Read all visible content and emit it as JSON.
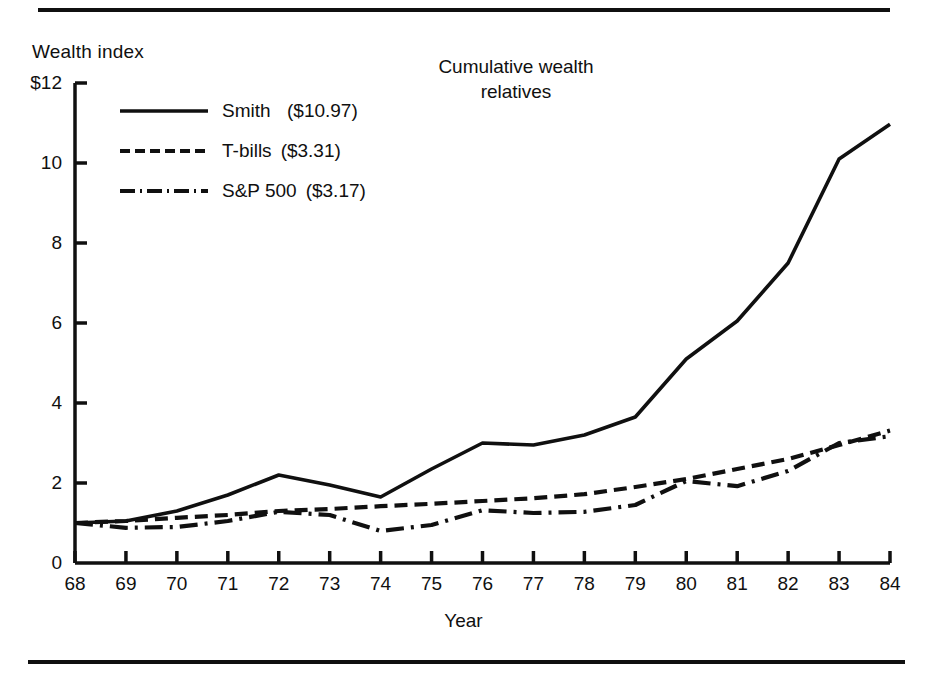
{
  "figure": {
    "title_line_1": "Cumulative wealth",
    "title_line_2": "relatives",
    "y_axis_title": "Wealth index",
    "x_axis_title": "Year"
  },
  "legend": {
    "items": [
      {
        "name": "Smith",
        "label": "Smith",
        "value": "($10.97)",
        "style": "solid",
        "color": "#101010"
      },
      {
        "name": "T-bills",
        "label": "T-bills",
        "value": "($3.31)",
        "style": "dashed",
        "color": "#101010"
      },
      {
        "name": "S&P 500",
        "label": "S&P 500",
        "value": "($3.17)",
        "style": "dash-dot",
        "color": "#101010"
      }
    ]
  },
  "chart_data": {
    "type": "line",
    "title": "Cumulative wealth relatives",
    "xlabel": "Year",
    "ylabel": "Wealth index",
    "xlim": [
      68,
      84
    ],
    "ylim": [
      0,
      12
    ],
    "yticks": [
      0,
      2,
      4,
      6,
      8,
      10,
      12
    ],
    "ytick_labels": [
      "0",
      "2",
      "4",
      "6",
      "8",
      "10",
      "$12"
    ],
    "xticks": [
      68,
      69,
      70,
      71,
      72,
      73,
      74,
      75,
      76,
      77,
      78,
      79,
      80,
      81,
      82,
      83,
      84
    ],
    "xtick_labels": [
      "68",
      "69",
      "70",
      "71",
      "72",
      "73",
      "74",
      "75",
      "76",
      "77",
      "78",
      "79",
      "80",
      "81",
      "82",
      "83",
      "84"
    ],
    "grid": false,
    "legend_position": "upper-left-inside",
    "x": [
      68,
      69,
      70,
      71,
      72,
      73,
      74,
      75,
      76,
      77,
      78,
      79,
      80,
      81,
      82,
      83,
      84
    ],
    "series": [
      {
        "name": "Smith",
        "line_style": "solid",
        "final_value": 10.97,
        "values": [
          1.0,
          1.05,
          1.3,
          1.7,
          2.2,
          1.95,
          1.65,
          2.35,
          3.0,
          2.95,
          3.2,
          3.65,
          5.1,
          6.05,
          7.5,
          10.1,
          10.97
        ]
      },
      {
        "name": "T-bills",
        "line_style": "dashed",
        "final_value": 3.31,
        "values": [
          1.0,
          1.05,
          1.13,
          1.2,
          1.3,
          1.35,
          1.42,
          1.48,
          1.55,
          1.62,
          1.72,
          1.9,
          2.1,
          2.35,
          2.6,
          2.95,
          3.31
        ]
      },
      {
        "name": "S&P 500",
        "line_style": "dash-dot",
        "final_value": 3.17,
        "values": [
          1.0,
          0.88,
          0.9,
          1.05,
          1.28,
          1.2,
          0.8,
          0.95,
          1.32,
          1.25,
          1.28,
          1.45,
          2.05,
          1.92,
          2.3,
          3.0,
          3.17
        ]
      }
    ]
  }
}
